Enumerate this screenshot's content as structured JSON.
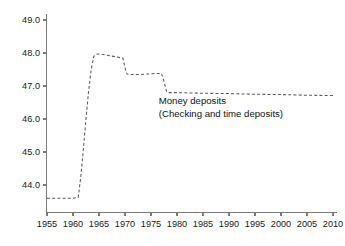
{
  "chart_data": {
    "type": "line",
    "title": "",
    "subtitle": "",
    "xlabel": "",
    "ylabel": "",
    "grid": false,
    "legend_position": "none",
    "line_style": "dashed",
    "line_color": "#5b5b5b",
    "axis_color": "#7a7a7a",
    "xlim": [
      1955,
      2010
    ],
    "ylim": [
      43.4,
      49.2
    ],
    "xticks": [
      1955,
      1960,
      1965,
      1970,
      1975,
      1980,
      1985,
      1990,
      1995,
      2000,
      2005,
      2010
    ],
    "xticklabels": [
      "1955",
      "1960",
      "1965",
      "1970",
      "1975",
      "1980",
      "1985",
      "1990",
      "1995",
      "2000",
      "2005",
      "2010"
    ],
    "yticks": [
      44.0,
      45.0,
      46.0,
      47.0,
      48.0,
      49.0
    ],
    "yticklabels": [
      "44.0",
      "45.0",
      "46.0",
      "47.0",
      "48.0",
      "49.0"
    ],
    "annotations": [
      {
        "id": "series-label",
        "line1": "Money deposits",
        "line2": "(Checking and time deposits)",
        "x": 1976.5,
        "y": 46.45
      }
    ],
    "series": [
      {
        "name": "Money deposits (Checking and time deposits)",
        "x": [
          1955,
          1956,
          1957,
          1958,
          1959,
          1960,
          1961,
          1961.5,
          1962,
          1962.5,
          1963,
          1963.5,
          1964,
          1964.5,
          1965,
          1966,
          1967,
          1968,
          1969,
          1969.6,
          1970,
          1970.4,
          1971,
          1972,
          1973,
          1974,
          1975,
          1976,
          1977,
          1977.4,
          1978,
          1978.4,
          1979,
          1980,
          1982,
          1985,
          1990,
          1995,
          2000,
          2005,
          2010
        ],
        "y": [
          43.6,
          43.6,
          43.6,
          43.6,
          43.6,
          43.6,
          43.62,
          44.25,
          45.1,
          46.0,
          46.85,
          47.5,
          47.9,
          47.96,
          47.97,
          47.95,
          47.92,
          47.89,
          47.86,
          47.84,
          47.55,
          47.36,
          47.35,
          47.35,
          47.35,
          47.36,
          47.37,
          47.38,
          47.38,
          47.2,
          46.83,
          46.8,
          46.8,
          46.8,
          46.79,
          46.78,
          46.77,
          46.75,
          46.74,
          46.72,
          46.71
        ]
      }
    ]
  }
}
